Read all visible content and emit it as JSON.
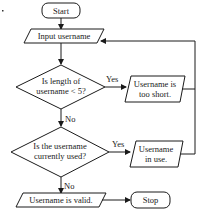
{
  "flowchart": {
    "start": {
      "label": "Start"
    },
    "input": {
      "label": "Input username"
    },
    "decision1": {
      "line1": "Is length of",
      "line2": "username < 5?"
    },
    "decision1_yes": "Yes",
    "decision1_no": "No",
    "output_short": {
      "line1": "Username is",
      "line2": "too short."
    },
    "decision2": {
      "line1": "Is the username",
      "line2": "currently used?"
    },
    "decision2_yes": "Yes",
    "decision2_no": "No",
    "output_inuse": {
      "line1": "Username",
      "line2": "in use."
    },
    "output_valid": {
      "label": "Username is valid."
    },
    "stop": {
      "label": "Stop"
    }
  }
}
